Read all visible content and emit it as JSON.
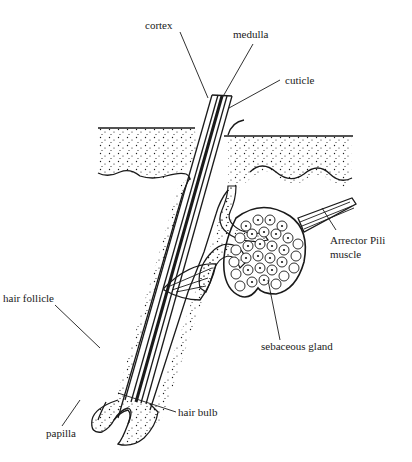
{
  "diagram": {
    "title": "",
    "colors": {
      "ink": "#1a1a1a",
      "background": "#ffffff"
    },
    "labels": {
      "medulla": "medulla",
      "cortex": "cortex",
      "cuticle": "cuticle",
      "hair_follicle": "hair follicle",
      "arrector_pili_line1": "Arrector Pili",
      "arrector_pili_line2": "muscle",
      "sebaceous_gland": "sebaceous gland",
      "hair_bulb": "hair bulb",
      "papilla": "papilla"
    }
  }
}
